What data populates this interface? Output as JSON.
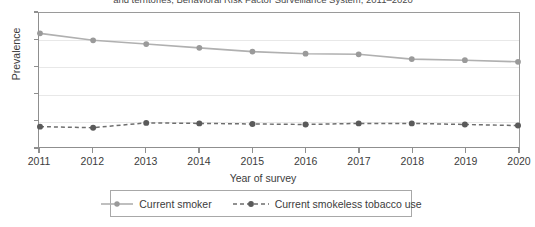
{
  "title": {
    "text": "and territories, Behavioral Risk Factor Surveillance System, 2011–2020",
    "note": "clipped at top of image"
  },
  "axes": {
    "ylabel": "Prevalence",
    "xlabel": "Year of survey"
  },
  "colors": {
    "smoker_line": "#b0b0b0",
    "smoker_marker": "#9a9a9a",
    "smokeless_line": "#6e6e6e",
    "smokeless_marker": "#5a5a5a",
    "axis": "#8f8f8f",
    "grid": "#e8e8e8",
    "text": "#3c3c3c"
  },
  "chart_data": {
    "type": "line",
    "title": "and territories, Behavioral Risk Factor Surveillance System, 2011–2020",
    "xlabel": "Year of survey",
    "ylabel": "Prevalence",
    "x": [
      2011,
      2012,
      2013,
      2014,
      2015,
      2016,
      2017,
      2018,
      2019,
      2020
    ],
    "categories": [
      "2011",
      "2012",
      "2013",
      "2014",
      "2015",
      "2016",
      "2017",
      "2018",
      "2019",
      "2020"
    ],
    "xlim": [
      2011,
      2020
    ],
    "ylim": [
      0,
      25
    ],
    "yticks": [
      0,
      5,
      10,
      15,
      20,
      25
    ],
    "ytick_labels": [
      "0",
      "5",
      "10",
      "15",
      "20",
      "25"
    ],
    "grid": true,
    "legend_position": "bottom",
    "series": [
      {
        "name": "Current smoker",
        "values": [
          21.2,
          19.9,
          19.2,
          18.5,
          17.8,
          17.4,
          17.3,
          16.4,
          16.2,
          15.9
        ],
        "linestyle": "solid",
        "marker": "circle",
        "color": "#b0b0b0"
      },
      {
        "name": "Current smokeless tobacco use",
        "values": [
          3.8,
          3.6,
          4.5,
          4.4,
          4.3,
          4.2,
          4.4,
          4.4,
          4.2,
          4.0
        ],
        "linestyle": "dashed",
        "marker": "circle",
        "color": "#6e6e6e"
      }
    ]
  },
  "legend": {
    "items": [
      {
        "label": "Current smoker",
        "style": "solid"
      },
      {
        "label": "Current smokeless tobacco use",
        "style": "dashed"
      }
    ]
  }
}
